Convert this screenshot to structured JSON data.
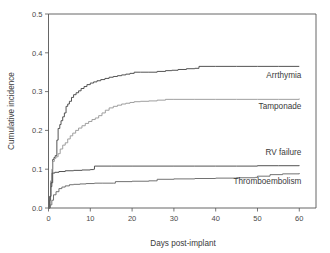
{
  "chart_data": {
    "type": "line",
    "title": "",
    "xlabel": "Days post-implant",
    "ylabel": "Cumulative incidence",
    "xlim": [
      0,
      64
    ],
    "ylim": [
      0.0,
      0.5
    ],
    "xticks": [
      0,
      10,
      20,
      30,
      40,
      50,
      60
    ],
    "xticklabels": [
      "0",
      "10",
      "20",
      "30",
      "40",
      "50",
      "60"
    ],
    "yticks": [
      0.0,
      0.1,
      0.2,
      0.3,
      0.4,
      0.5
    ],
    "yticklabels": [
      "0.0",
      "0.1",
      "0.2",
      "0.3",
      "0.4",
      "0.5"
    ],
    "grid": false,
    "legend_position": "right-inline-annotations",
    "series": [
      {
        "name": "Arrthymia",
        "label": "Arrthymia",
        "color": "#4a4a4a",
        "label_x": 60.5,
        "label_y": 0.335,
        "step": "post",
        "x": [
          0,
          0.3,
          0.5,
          0.8,
          1.0,
          1.3,
          1.6,
          2.0,
          2.3,
          2.7,
          3.0,
          3.4,
          3.8,
          4.2,
          4.6,
          5.0,
          5.5,
          6.0,
          6.6,
          7.2,
          7.8,
          8.5,
          9.2,
          10.0,
          10.8,
          11.6,
          12.5,
          13.5,
          14.5,
          15.5,
          16.5,
          17.5,
          18.5,
          19.5,
          20.5,
          22.0,
          24.0,
          26.0,
          28.0,
          29.5,
          31.0,
          33.0,
          35.0,
          36.0,
          40.0,
          45.0,
          50.0,
          55.0,
          60.0
        ],
        "y": [
          0.0,
          0.02,
          0.055,
          0.09,
          0.125,
          0.13,
          0.135,
          0.175,
          0.205,
          0.215,
          0.225,
          0.235,
          0.245,
          0.262,
          0.268,
          0.275,
          0.285,
          0.292,
          0.297,
          0.302,
          0.308,
          0.313,
          0.318,
          0.322,
          0.325,
          0.328,
          0.331,
          0.334,
          0.337,
          0.339,
          0.341,
          0.343,
          0.345,
          0.347,
          0.35,
          0.35,
          0.35,
          0.352,
          0.354,
          0.355,
          0.357,
          0.359,
          0.36,
          0.365,
          0.365,
          0.365,
          0.365,
          0.365,
          0.365
        ]
      },
      {
        "name": "Tamponade",
        "label": "Tamponade",
        "color": "#9a9a9a",
        "label_x": 60.5,
        "label_y": 0.255,
        "step": "post",
        "x": [
          0,
          0.3,
          0.5,
          0.8,
          1.0,
          1.4,
          1.8,
          2.3,
          2.8,
          3.4,
          4.0,
          4.6,
          5.2,
          5.8,
          6.5,
          7.2,
          8.0,
          8.8,
          9.6,
          10.4,
          11.2,
          12.0,
          12.8,
          13.6,
          14.5,
          15.5,
          16.5,
          17.5,
          18.5,
          19.5,
          20.5,
          22.0,
          24.0,
          26.0,
          28.0,
          30.0,
          35.0,
          40.0,
          45.0,
          50.0,
          55.0,
          60.0
        ],
        "y": [
          0.0,
          0.03,
          0.07,
          0.1,
          0.12,
          0.128,
          0.132,
          0.14,
          0.152,
          0.162,
          0.168,
          0.178,
          0.186,
          0.193,
          0.2,
          0.206,
          0.212,
          0.218,
          0.223,
          0.228,
          0.232,
          0.238,
          0.245,
          0.252,
          0.258,
          0.262,
          0.265,
          0.268,
          0.27,
          0.272,
          0.274,
          0.275,
          0.276,
          0.278,
          0.28,
          0.28,
          0.28,
          0.28,
          0.28,
          0.28,
          0.28,
          0.282
        ]
      },
      {
        "name": "RV failure",
        "label": "RV failure",
        "color": "#4a4a4a",
        "label_x": 60.5,
        "label_y": 0.137,
        "step": "post",
        "x": [
          0,
          0.3,
          0.6,
          1.0,
          1.5,
          2.5,
          4.0,
          6.0,
          8.0,
          10.0,
          10.8,
          11.0,
          15.0,
          20.0,
          25.0,
          30.0,
          35.0,
          40.0,
          45.0,
          50.0,
          55.0,
          60.0
        ],
        "y": [
          0.0,
          0.03,
          0.065,
          0.09,
          0.092,
          0.094,
          0.096,
          0.097,
          0.098,
          0.099,
          0.1,
          0.108,
          0.108,
          0.108,
          0.108,
          0.108,
          0.108,
          0.108,
          0.108,
          0.109,
          0.109,
          0.11
        ]
      },
      {
        "name": "Thromboembolism",
        "label": "Thromboembolism",
        "color": "#6a6a6a",
        "label_x": 60.5,
        "label_y": 0.062,
        "step": "post",
        "x": [
          0,
          0.4,
          0.8,
          1.2,
          1.8,
          2.5,
          3.2,
          4.0,
          5.0,
          6.0,
          7.5,
          9.0,
          11.0,
          13.0,
          15.5,
          16.0,
          20.0,
          24.0,
          25.5,
          26.0,
          30.0,
          35.0,
          40.0,
          45.0,
          49.5,
          50.0,
          52.5,
          53.0,
          56.0,
          60.0
        ],
        "y": [
          0.0,
          0.008,
          0.02,
          0.034,
          0.042,
          0.05,
          0.054,
          0.057,
          0.06,
          0.061,
          0.062,
          0.063,
          0.064,
          0.064,
          0.064,
          0.068,
          0.069,
          0.07,
          0.07,
          0.074,
          0.075,
          0.076,
          0.077,
          0.078,
          0.079,
          0.082,
          0.082,
          0.086,
          0.088,
          0.09
        ]
      }
    ]
  }
}
